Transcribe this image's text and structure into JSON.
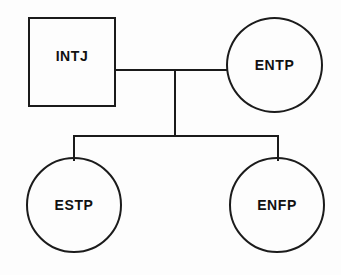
{
  "diagram": {
    "type": "genogram",
    "background_color": "#fdfdfd",
    "stroke_color": "#1b1b1b",
    "nodes": [
      {
        "id": "intj",
        "label": "INTJ",
        "shape": "square",
        "role": "parent",
        "shape_meaning": "male"
      },
      {
        "id": "entp",
        "label": "ENTP",
        "shape": "circle",
        "role": "parent",
        "shape_meaning": "female"
      },
      {
        "id": "estp",
        "label": "ESTP",
        "shape": "circle",
        "role": "child",
        "shape_meaning": "female"
      },
      {
        "id": "enfp",
        "label": "ENFP",
        "shape": "circle",
        "role": "child",
        "shape_meaning": "female"
      }
    ],
    "links": [
      {
        "id": "partner",
        "from": "intj",
        "to": "entp",
        "kind": "partner-line"
      },
      {
        "id": "descent",
        "from": "partner",
        "to": "sibling-bar",
        "kind": "descent-line"
      },
      {
        "id": "sibling-bar",
        "from": "descent",
        "to": "children",
        "kind": "sibling-bar"
      },
      {
        "id": "child-left",
        "from": "sibling-bar",
        "to": "estp",
        "kind": "child-line"
      },
      {
        "id": "child-right",
        "from": "sibling-bar",
        "to": "enfp",
        "kind": "child-line"
      }
    ]
  }
}
